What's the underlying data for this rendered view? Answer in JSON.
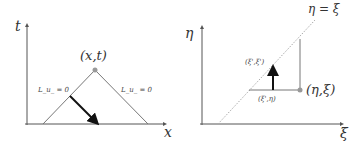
{
  "left_panel": {
    "y_axis_label": "t",
    "x_axis_label": "x",
    "apex_label": "(x,t)",
    "left_edge_label": "L_u_ = 0",
    "right_edge_label": "L_u_ = 0"
  },
  "right_panel": {
    "y_axis_label": "η",
    "x_axis_label": "ξ",
    "diagonal_label": "η = ξ",
    "point_label": "(η,ξ)",
    "upper_label": "(ξ',ξ')",
    "lower_label": "(ξ',η)"
  },
  "colors": {
    "axis": "#555555",
    "line": "#777777",
    "arrow": "#111111",
    "point": "#999999",
    "diagonal": "#aaaaaa"
  }
}
